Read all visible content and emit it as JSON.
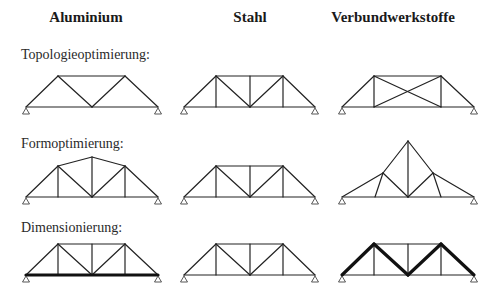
{
  "headers": {
    "aluminium": "Aluminium",
    "steel": "Stahl",
    "composite": "Verbundwerkstoffe"
  },
  "rows": {
    "topology": "Topologieoptimierung:",
    "shape": "Formoptimierung:",
    "sizing": "Dimensionierung:"
  },
  "colors": {
    "member": "#222222",
    "thick_member": "#111111",
    "support": "#444444"
  },
  "trusses": [
    {
      "row": "topology",
      "material": "aluminium",
      "members": [
        [
          26,
          107,
          58,
          76
        ],
        [
          58,
          76,
          125,
          76
        ],
        [
          125,
          76,
          158,
          107
        ],
        [
          26,
          107,
          158,
          107
        ],
        [
          58,
          76,
          92,
          107
        ],
        [
          92,
          107,
          125,
          76
        ]
      ],
      "thick": [],
      "supports": [
        [
          26,
          107
        ],
        [
          158,
          107
        ]
      ]
    },
    {
      "row": "topology",
      "material": "steel",
      "members": [
        [
          184,
          107,
          216,
          76
        ],
        [
          216,
          76,
          283,
          76
        ],
        [
          283,
          76,
          315,
          107
        ],
        [
          184,
          107,
          315,
          107
        ],
        [
          216,
          76,
          216,
          107
        ],
        [
          250,
          76,
          250,
          107
        ],
        [
          283,
          76,
          283,
          107
        ],
        [
          216,
          76,
          250,
          107
        ],
        [
          250,
          107,
          283,
          76
        ]
      ],
      "thick": [],
      "supports": [
        [
          184,
          107
        ],
        [
          315,
          107
        ]
      ]
    },
    {
      "row": "topology",
      "material": "composite",
      "members": [
        [
          342,
          107,
          374,
          76
        ],
        [
          374,
          76,
          441,
          76
        ],
        [
          441,
          76,
          474,
          107
        ],
        [
          342,
          107,
          474,
          107
        ],
        [
          374,
          76,
          374,
          107
        ],
        [
          441,
          76,
          441,
          107
        ],
        [
          374,
          76,
          441,
          107
        ],
        [
          374,
          107,
          441,
          76
        ]
      ],
      "thick": [],
      "supports": [
        [
          342,
          107
        ],
        [
          474,
          107
        ]
      ]
    },
    {
      "row": "shape",
      "material": "aluminium",
      "members": [
        [
          26,
          197,
          58,
          166
        ],
        [
          58,
          166,
          92,
          157
        ],
        [
          92,
          157,
          125,
          166
        ],
        [
          125,
          166,
          158,
          197
        ],
        [
          26,
          197,
          158,
          197
        ],
        [
          58,
          166,
          58,
          197
        ],
        [
          92,
          157,
          92,
          197
        ],
        [
          125,
          166,
          125,
          197
        ],
        [
          58,
          166,
          92,
          197
        ],
        [
          92,
          197,
          125,
          166
        ]
      ],
      "thick": [],
      "supports": [
        [
          26,
          197
        ],
        [
          158,
          197
        ]
      ]
    },
    {
      "row": "shape",
      "material": "steel",
      "members": [
        [
          184,
          197,
          216,
          166
        ],
        [
          216,
          166,
          283,
          166
        ],
        [
          283,
          166,
          315,
          197
        ],
        [
          184,
          197,
          315,
          197
        ],
        [
          216,
          166,
          216,
          197
        ],
        [
          250,
          166,
          250,
          197
        ],
        [
          283,
          166,
          283,
          197
        ],
        [
          216,
          166,
          250,
          197
        ],
        [
          250,
          197,
          283,
          166
        ]
      ],
      "thick": [],
      "supports": [
        [
          184,
          197
        ],
        [
          315,
          197
        ]
      ]
    },
    {
      "row": "shape",
      "material": "composite",
      "members": [
        [
          342,
          197,
          383,
          173
        ],
        [
          383,
          173,
          408,
          141
        ],
        [
          408,
          141,
          433,
          173
        ],
        [
          433,
          173,
          474,
          197
        ],
        [
          342,
          197,
          474,
          197
        ],
        [
          408,
          141,
          408,
          197
        ],
        [
          383,
          173,
          375,
          197
        ],
        [
          383,
          173,
          408,
          197
        ],
        [
          408,
          197,
          433,
          173
        ],
        [
          433,
          173,
          441,
          197
        ]
      ],
      "thick": [],
      "supports": [
        [
          342,
          197
        ],
        [
          474,
          197
        ]
      ]
    },
    {
      "row": "sizing",
      "material": "aluminium",
      "members": [
        [
          26,
          275,
          58,
          244
        ],
        [
          58,
          244,
          125,
          244
        ],
        [
          125,
          244,
          158,
          275
        ],
        [
          58,
          244,
          58,
          275
        ],
        [
          92,
          244,
          92,
          275
        ],
        [
          125,
          244,
          125,
          275
        ],
        [
          58,
          244,
          92,
          275
        ],
        [
          92,
          275,
          125,
          244
        ]
      ],
      "thick": [
        [
          26,
          275,
          158,
          275
        ]
      ],
      "supports": [
        [
          26,
          275
        ],
        [
          158,
          275
        ]
      ]
    },
    {
      "row": "sizing",
      "material": "steel",
      "members": [
        [
          184,
          275,
          216,
          244
        ],
        [
          216,
          244,
          283,
          244
        ],
        [
          283,
          244,
          315,
          275
        ],
        [
          184,
          275,
          315,
          275
        ],
        [
          216,
          244,
          216,
          275
        ],
        [
          250,
          244,
          250,
          275
        ],
        [
          283,
          244,
          283,
          275
        ],
        [
          216,
          244,
          250,
          275
        ],
        [
          250,
          275,
          283,
          244
        ]
      ],
      "thick": [],
      "supports": [
        [
          184,
          275
        ],
        [
          315,
          275
        ]
      ]
    },
    {
      "row": "sizing",
      "material": "composite",
      "members": [
        [
          374,
          244,
          441,
          244
        ],
        [
          342,
          275,
          474,
          275
        ],
        [
          374,
          244,
          374,
          275
        ],
        [
          408,
          244,
          408,
          275
        ],
        [
          441,
          244,
          441,
          275
        ]
      ],
      "thick": [
        [
          342,
          275,
          374,
          244
        ],
        [
          374,
          244,
          408,
          275
        ],
        [
          408,
          275,
          441,
          244
        ],
        [
          441,
          244,
          474,
          275
        ]
      ],
      "supports": [
        [
          342,
          275
        ],
        [
          474,
          275
        ]
      ]
    }
  ]
}
